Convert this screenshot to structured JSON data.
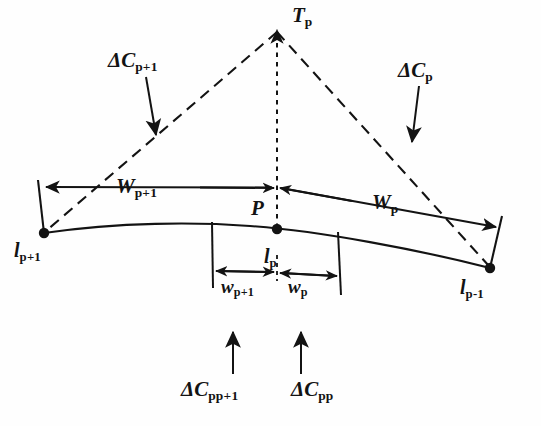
{
  "figure": {
    "type": "line-diagram",
    "background_color": "#fefefe",
    "ink_color": "#131313",
    "labels": {
      "apex": {
        "symbol": "T",
        "subscript": "p",
        "text": "T p"
      },
      "left_dashed": {
        "symbol": "ΔC",
        "subscript": "p+1",
        "text": "ΔC p+1"
      },
      "right_dashed": {
        "symbol": "ΔC",
        "subscript": "p",
        "text": "ΔC p"
      },
      "width_left": {
        "symbol": "W",
        "subscript": "p+1",
        "text": "W p+1"
      },
      "width_right": {
        "symbol": "W",
        "subscript": "p",
        "text": "W p"
      },
      "point_p": {
        "symbol": "P",
        "subscript": "",
        "text": "P"
      },
      "node_left": {
        "symbol": "l",
        "subscript": "p+1",
        "text": "l p+1"
      },
      "node_center": {
        "symbol": "l",
        "subscript": "p",
        "text": "l p"
      },
      "node_right": {
        "symbol": "l",
        "subscript": "p-1",
        "text": "l p-1"
      },
      "small_width_left": {
        "symbol": "w",
        "subscript": "p+1",
        "text": "w p+1"
      },
      "small_width_right": {
        "symbol": "w",
        "subscript": "p",
        "text": "w p"
      },
      "bottom_left": {
        "symbol": "ΔC",
        "subscript": "pp+1",
        "text": "ΔC pp+1"
      },
      "bottom_right": {
        "symbol": "ΔC",
        "subscript": "pp",
        "text": "ΔC pp"
      }
    },
    "geometry": {
      "apex": [
        277,
        27
      ],
      "node_left": [
        44,
        233
      ],
      "node_right": [
        490,
        268
      ],
      "point_p": [
        277,
        229
      ],
      "curve_peak": [
        250,
        226
      ],
      "dimension_line_y": 272,
      "extension_left_x": 212,
      "extension_right_x": 338,
      "width_line_y": 187
    }
  }
}
